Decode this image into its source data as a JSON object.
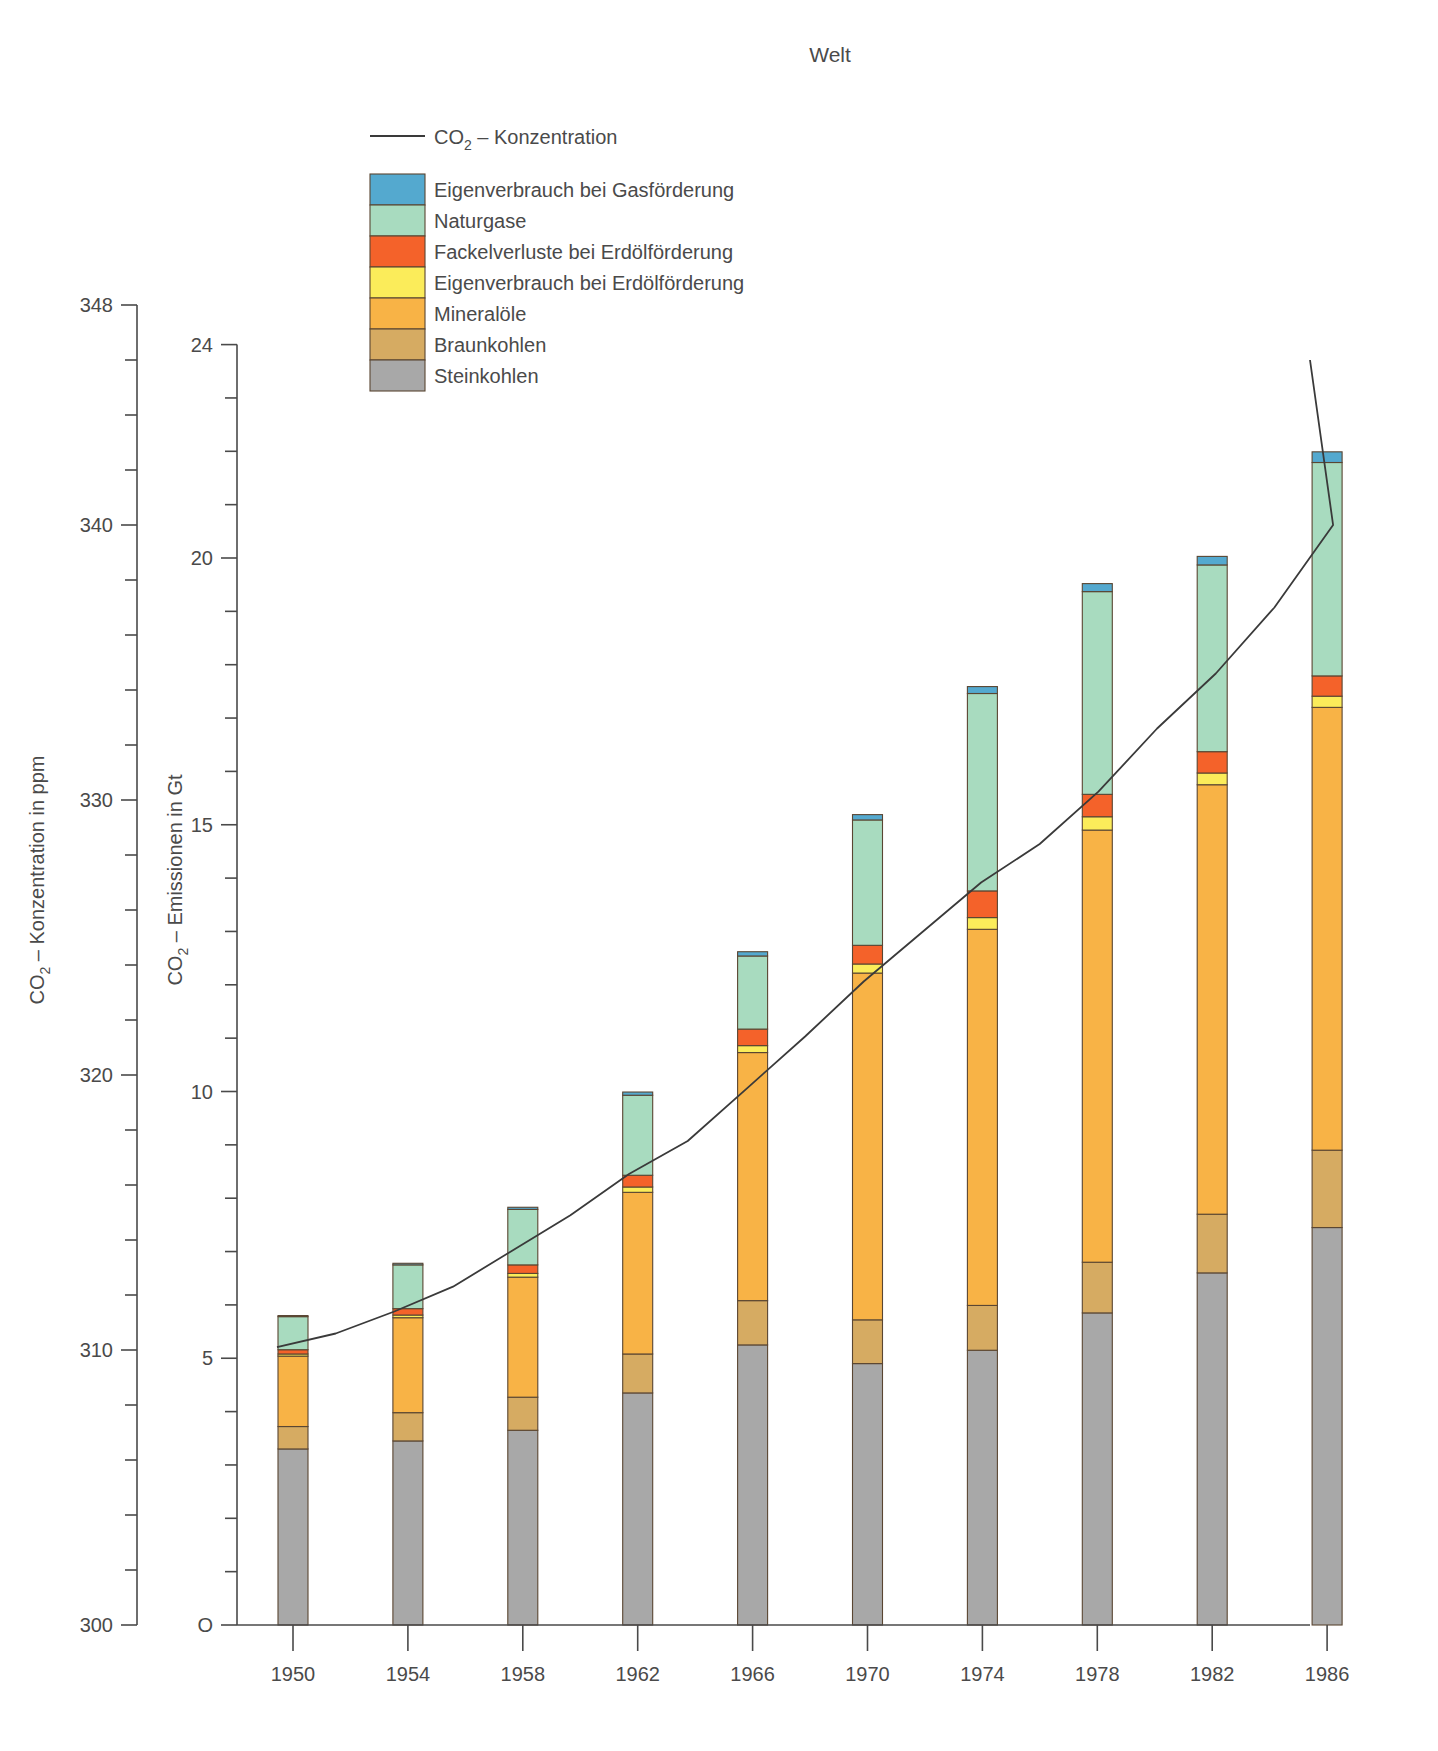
{
  "title": "Welt",
  "axes": {
    "left": {
      "label_main": "CO",
      "label_sub": "2",
      "label_rest": "– Konzentration in ppm",
      "ticks": [
        300,
        310,
        320,
        330,
        340,
        348
      ],
      "min": 300,
      "max": 348,
      "minor_step": 2
    },
    "right_inner": {
      "label_main": "CO",
      "label_sub": "2",
      "label_rest": "– Emissionen in Gt",
      "ticks": [
        "O",
        5,
        10,
        15,
        20,
        24
      ],
      "min": 0,
      "max": 24,
      "minor_step": 1
    }
  },
  "legend": {
    "line_entry": {
      "label_main": "CO",
      "label_sub": "2",
      "label_rest": "– Konzentration",
      "color": "#3a3a3a"
    },
    "items": [
      {
        "label": "Eigenverbrauch bei Gasförderung",
        "color": "#54a9cf",
        "key": "gas_own_use"
      },
      {
        "label": "Naturgase",
        "color": "#a8dbbf",
        "key": "natural_gas"
      },
      {
        "label": "Fackelverluste bei Erdölförderung",
        "color": "#f4622a",
        "key": "flaring"
      },
      {
        "label": "Eigenverbrauch bei Erdölförderung",
        "color": "#fbec5a",
        "key": "oil_own_use"
      },
      {
        "label": "Mineralöle",
        "color": "#f8b346",
        "key": "mineral_oils"
      },
      {
        "label": "Braunkohlen",
        "color": "#d6ab62",
        "key": "lignite"
      },
      {
        "label": "Steinkohlen",
        "color": "#a8a8a8",
        "key": "hard_coal"
      }
    ]
  },
  "chart_data": {
    "type": "bar",
    "title": "Welt",
    "xlabel": "",
    "ylabel": "CO2 – Emissionen in Gt",
    "ylim": [
      0,
      24
    ],
    "y2lim": [
      300,
      348
    ],
    "y2label": "CO2 – Konzentration in ppm",
    "grid": false,
    "legend_position": "top-left",
    "categories": [
      "1950",
      "1954",
      "1958",
      "1962",
      "1966",
      "1970",
      "1974",
      "1978",
      "1982",
      "1986"
    ],
    "stack_order_bottom_to_top": [
      "hard_coal",
      "lignite",
      "mineral_oils",
      "oil_own_use",
      "flaring",
      "natural_gas",
      "gas_own_use"
    ],
    "series": [
      {
        "name": "Steinkohlen",
        "key": "hard_coal",
        "color": "#a8a8a8",
        "values": [
          3.3,
          3.45,
          3.65,
          4.35,
          5.25,
          4.9,
          5.15,
          5.85,
          6.6,
          7.45
        ]
      },
      {
        "name": "Braunkohlen",
        "key": "lignite",
        "color": "#d6ab62",
        "values": [
          0.42,
          0.53,
          0.62,
          0.73,
          0.83,
          0.82,
          0.84,
          0.95,
          1.1,
          1.45
        ]
      },
      {
        "name": "Mineralöle",
        "key": "mineral_oils",
        "color": "#f8b346",
        "values": [
          1.32,
          1.78,
          2.25,
          3.03,
          4.65,
          6.5,
          7.05,
          8.1,
          8.05,
          8.3
        ]
      },
      {
        "name": "Eigenverbrauch bei Erdölförderung",
        "key": "oil_own_use",
        "color": "#fbec5a",
        "values": [
          0.04,
          0.05,
          0.07,
          0.1,
          0.13,
          0.17,
          0.22,
          0.25,
          0.22,
          0.21
        ]
      },
      {
        "name": "Fackelverluste bei Erdölförderung",
        "key": "flaring",
        "color": "#f4622a",
        "values": [
          0.08,
          0.12,
          0.16,
          0.22,
          0.31,
          0.35,
          0.5,
          0.42,
          0.4,
          0.38
        ]
      },
      {
        "name": "Naturgase",
        "key": "natural_gas",
        "color": "#a8dbbf",
        "values": [
          0.62,
          0.82,
          1.04,
          1.5,
          1.37,
          2.35,
          3.7,
          3.8,
          3.5,
          4.0
        ]
      },
      {
        "name": "Eigenverbrauch bei Gasförderung",
        "key": "gas_own_use",
        "color": "#54a9cf",
        "values": [
          0.02,
          0.03,
          0.04,
          0.06,
          0.08,
          0.1,
          0.13,
          0.15,
          0.16,
          0.2
        ]
      }
    ],
    "totals": [
      5.8,
      6.78,
      7.83,
      9.99,
      12.62,
      15.19,
      17.59,
      19.52,
      20.03,
      21.99
    ],
    "line_series": {
      "name": "CO2 – Konzentration",
      "unit": "ppm",
      "color": "#3a3a3a",
      "x": [
        "1950",
        "1952",
        "1954",
        "1956",
        "1958",
        "1960",
        "1962",
        "1964",
        "1966",
        "1968",
        "1970",
        "1972",
        "1974",
        "1976",
        "1978",
        "1980",
        "1982",
        "1984",
        "1986"
      ],
      "values": [
        310.1,
        310.6,
        311.4,
        312.3,
        313.6,
        314.9,
        316.4,
        317.6,
        319.5,
        321.4,
        323.4,
        325.2,
        327.0,
        328.4,
        330.3,
        332.6,
        334.6,
        337.0,
        340.0
      ],
      "end_value": 346.0
    }
  }
}
